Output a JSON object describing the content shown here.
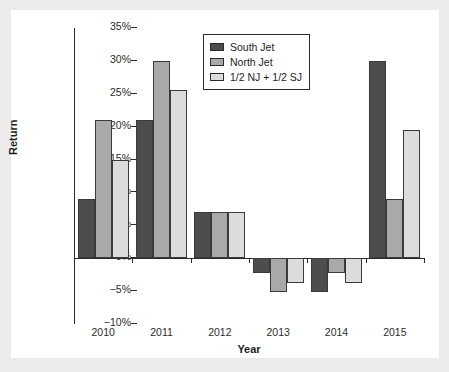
{
  "chart_data": {
    "type": "bar",
    "title": "",
    "xlabel": "Year",
    "ylabel": "Return",
    "categories": [
      "2010",
      "2011",
      "2012",
      "2013",
      "2014",
      "2015"
    ],
    "series": [
      {
        "name": "South Jet",
        "color": "#4d4d4d",
        "values": [
          9,
          21,
          7,
          -2.2,
          -5.2,
          30
        ]
      },
      {
        "name": "North Jet",
        "color": "#a9a9a9",
        "values": [
          21,
          30,
          7,
          -5.2,
          -2.2,
          9
        ]
      },
      {
        "name": "1/2 NJ + 1/2 SJ",
        "color": "#dcdcdc",
        "values": [
          15,
          25.5,
          7,
          -3.7,
          -3.7,
          19.5
        ]
      }
    ],
    "ylim": [
      -10,
      35
    ],
    "ytick_values": [
      35,
      30,
      25,
      20,
      15,
      10,
      5,
      0,
      -5,
      -10
    ],
    "ytick_labels": [
      "35%",
      "30%",
      "25%",
      "20%",
      "15%",
      "10%",
      "5%",
      "0%",
      "−5%",
      "−10%"
    ],
    "grid": false,
    "legend_position": "top-center",
    "value_suffix": "%"
  },
  "figure": {
    "background_color": "#ffffff",
    "page_background_color": "#ebebeb",
    "axis_color": "#2b2b2b"
  }
}
